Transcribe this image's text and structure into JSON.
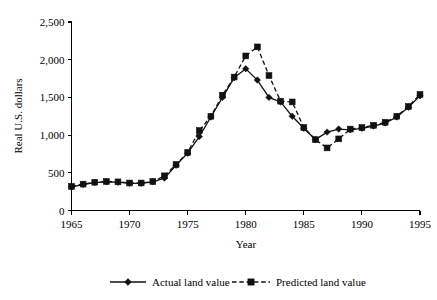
{
  "chart_data": {
    "type": "line",
    "title": "",
    "xlabel": "Year",
    "ylabel": "Real U.S. dollars",
    "xlim": [
      1965,
      1995
    ],
    "ylim": [
      0,
      2500
    ],
    "xticks": [
      1965,
      1970,
      1975,
      1980,
      1985,
      1990,
      1995
    ],
    "xtick_labels": [
      "1965",
      "1970",
      "1975",
      "1980",
      "1985",
      "1990",
      "1995"
    ],
    "yticks": [
      0,
      500,
      1000,
      1500,
      2000,
      2500
    ],
    "ytick_labels": [
      "0",
      "500",
      "1,000",
      "1,500",
      "2,000",
      "2,500"
    ],
    "grid": false,
    "legend_position": "bottom",
    "x": [
      1965,
      1966,
      1967,
      1968,
      1969,
      1970,
      1971,
      1972,
      1973,
      1974,
      1975,
      1976,
      1977,
      1978,
      1979,
      1980,
      1981,
      1982,
      1983,
      1984,
      1985,
      1986,
      1987,
      1988,
      1989,
      1990,
      1991,
      1992,
      1993,
      1994,
      1995
    ],
    "series": [
      {
        "name": "Actual land value",
        "marker": "diamond",
        "linestyle": "solid",
        "color": "#111111",
        "values": [
          310,
          345,
          370,
          380,
          375,
          360,
          360,
          380,
          430,
          600,
          760,
          980,
          1240,
          1500,
          1760,
          1880,
          1730,
          1500,
          1440,
          1250,
          1090,
          940,
          1040,
          1080,
          1070,
          1090,
          1120,
          1160,
          1240,
          1370,
          1520
        ]
      },
      {
        "name": "Predicted land value",
        "marker": "square",
        "linestyle": "dashed",
        "color": "#111111",
        "values": [
          320,
          350,
          375,
          385,
          380,
          365,
          365,
          385,
          460,
          610,
          770,
          1060,
          1250,
          1530,
          1770,
          2050,
          2170,
          1790,
          1450,
          1440,
          1100,
          940,
          830,
          950,
          1080,
          1100,
          1130,
          1170,
          1250,
          1380,
          1540
        ]
      }
    ]
  },
  "legend": {
    "items": [
      {
        "label": "Actual land value",
        "marker": "diamond",
        "linestyle": "solid"
      },
      {
        "label": "Predicted land value",
        "marker": "square",
        "linestyle": "dashed"
      }
    ]
  },
  "axes": {
    "y_title": "Real U.S. dollars",
    "x_title": "Year"
  }
}
